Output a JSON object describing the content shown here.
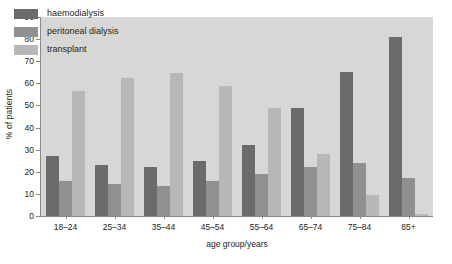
{
  "chart_data": {
    "type": "bar",
    "title": "",
    "xlabel": "age group/years",
    "ylabel": "% of patients",
    "categories": [
      "18–24",
      "25–34",
      "35–44",
      "45–54",
      "55–64",
      "65–74",
      "75–84",
      "85+"
    ],
    "series": [
      {
        "name": "haemodialysis",
        "color": "#6b6b6b",
        "values": [
          27,
          23,
          22,
          25,
          32,
          49,
          65,
          81
        ]
      },
      {
        "name": "peritoneal dialysis",
        "color": "#909090",
        "values": [
          16,
          14.5,
          13.5,
          16,
          19,
          22,
          24,
          17
        ]
      },
      {
        "name": "transplant",
        "color": "#b7b7b5",
        "values": [
          56.5,
          62.5,
          64.5,
          59,
          49,
          28,
          9.5,
          1
        ]
      }
    ],
    "ylim": [
      0,
      90
    ],
    "yticks": [
      0,
      10,
      20,
      30,
      40,
      50,
      60,
      70,
      80,
      90
    ],
    "ytick_labels": [
      "0",
      "10",
      "20",
      "30",
      "40",
      "50",
      "60",
      "70",
      "80",
      "90"
    ],
    "grid": false,
    "legend_position": "upper-left",
    "plot_background": "#d7d7d5",
    "figure_background": "#ffffff",
    "axis_color": "#8a8a88",
    "text_color": "#231f20"
  }
}
